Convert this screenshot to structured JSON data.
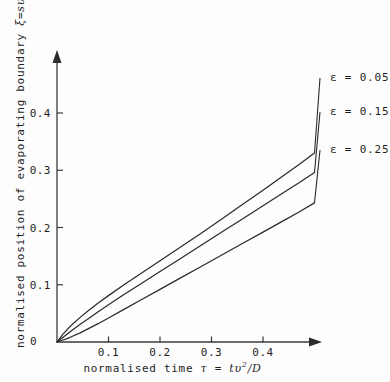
{
  "chart_data": {
    "type": "line",
    "title": "",
    "xlabel": "normalised time τ = tυ²/D",
    "ylabel": "normalised position of evaporating boundary ξ=sυ/D",
    "xlabel_parts": {
      "prefix": "normalised time ",
      "tau": "τ",
      "equals": " = ",
      "expr_t": "t",
      "expr_v": "υ",
      "expr_exp": "2",
      "expr_div": "/",
      "expr_D": "D"
    },
    "ylabel_parts": {
      "prefix": "normalised position of evaporating boundary ",
      "xi": "ξ",
      "equals": "=",
      "expr_s": "s",
      "expr_v": "υ",
      "expr_div": "/",
      "expr_D": "D"
    },
    "xlim": [
      0,
      0.51
    ],
    "ylim": [
      0,
      0.5
    ],
    "xticks": [
      0.1,
      0.2,
      0.3,
      0.4
    ],
    "xtick_labels": [
      "0.1",
      "0.2",
      "0.3",
      "0.4"
    ],
    "yticks": [
      0.1,
      0.2,
      0.3,
      0.4
    ],
    "ytick_labels": [
      "0.1",
      "0.2",
      "0.3",
      "0.4"
    ],
    "origin_label": "0",
    "grid": false,
    "legend_position": "right-inline-annotations",
    "axis_arrows": true,
    "series": [
      {
        "name": "ε = 0.05",
        "label_symbol": "ε",
        "label_value": "0.05",
        "epsilon": 0.05,
        "x": [
          0.0,
          0.01,
          0.02,
          0.03,
          0.045,
          0.06,
          0.08,
          0.1,
          0.13,
          0.16,
          0.2,
          0.24,
          0.28,
          0.32,
          0.36,
          0.4,
          0.44,
          0.47,
          0.5
        ],
        "y": [
          0.0,
          0.012,
          0.022,
          0.031,
          0.043,
          0.054,
          0.068,
          0.081,
          0.1,
          0.118,
          0.142,
          0.166,
          0.19,
          0.215,
          0.24,
          0.265,
          0.291,
          0.31,
          0.33
        ]
      },
      {
        "name": "ε = 0.15",
        "label_symbol": "ε",
        "label_value": "0.15",
        "epsilon": 0.15,
        "x": [
          0.0,
          0.01,
          0.02,
          0.03,
          0.045,
          0.06,
          0.08,
          0.1,
          0.13,
          0.16,
          0.2,
          0.24,
          0.28,
          0.32,
          0.36,
          0.4,
          0.44,
          0.47,
          0.5
        ],
        "y": [
          0.0,
          0.007,
          0.014,
          0.021,
          0.031,
          0.04,
          0.053,
          0.065,
          0.083,
          0.1,
          0.123,
          0.146,
          0.169,
          0.192,
          0.215,
          0.238,
          0.261,
          0.278,
          0.296
        ]
      },
      {
        "name": "ε = 0.25",
        "label_symbol": "ε",
        "label_value": "0.25",
        "epsilon": 0.25,
        "x": [
          0.0,
          0.01,
          0.02,
          0.03,
          0.045,
          0.06,
          0.08,
          0.1,
          0.13,
          0.16,
          0.2,
          0.24,
          0.28,
          0.32,
          0.36,
          0.4,
          0.44,
          0.47,
          0.5
        ],
        "y": [
          0.0,
          0.003,
          0.006,
          0.01,
          0.016,
          0.023,
          0.032,
          0.042,
          0.057,
          0.072,
          0.092,
          0.112,
          0.132,
          0.152,
          0.172,
          0.192,
          0.212,
          0.227,
          0.243
        ]
      }
    ],
    "annotations": [
      {
        "text": "ε = 0.05",
        "series": 0
      },
      {
        "text": "ε = 0.15",
        "series": 1
      },
      {
        "text": "ε = 0.25",
        "series": 2
      }
    ],
    "colors": {
      "curve": "#2b2b2b",
      "axis": "#3a3a3a",
      "text": "#1f1f1f",
      "background": "#fdfdfd"
    }
  }
}
